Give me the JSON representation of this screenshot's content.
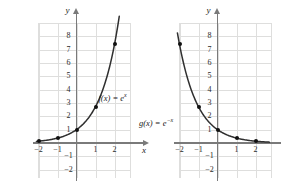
{
  "figure": {
    "title": "",
    "background": "#ffffff",
    "grid_color": "#dededd",
    "axis_color": "#7a7a7a",
    "curve_color": "#2f2f2f",
    "point_color": "#111111"
  },
  "chart_data": [
    {
      "type": "line",
      "title": "",
      "label": "f(x) = e^x",
      "label_display": "f(x) = e",
      "label_exponent": "x",
      "xlabel": "x",
      "ylabel": "y",
      "xlim": [
        -2.85,
        2.85
      ],
      "ylim": [
        -2.6,
        8.9
      ],
      "grid": true,
      "legend": "none",
      "x_ticks": [
        -2,
        -1,
        1,
        2
      ],
      "x_tick_labels": [
        "−2",
        "−1",
        "1",
        "2"
      ],
      "y_ticks": [
        8,
        7,
        6,
        5,
        4,
        3,
        2,
        1,
        -1,
        -2
      ],
      "y_tick_labels": [
        "8",
        "7",
        "6",
        "5",
        "4",
        "3",
        "2",
        "1",
        "−1",
        "−2"
      ],
      "points_x": [
        -2,
        -1,
        0,
        1,
        2
      ],
      "points_y": [
        0.14,
        0.37,
        1,
        2.72,
        7.39
      ],
      "curve_formula": "y = e^x"
    },
    {
      "type": "line",
      "title": "",
      "label": "g(x) = e^-x",
      "label_display": "g(x) = e",
      "label_exponent": "−x",
      "xlabel": "x",
      "ylabel": "y",
      "xlim": [
        -2.85,
        2.85
      ],
      "ylim": [
        -2.6,
        8.9
      ],
      "grid": true,
      "legend": "none",
      "x_ticks": [
        -2,
        -1,
        1,
        2
      ],
      "x_tick_labels": [
        "−2",
        "−1",
        "1",
        "2"
      ],
      "y_ticks": [
        8,
        7,
        6,
        5,
        4,
        3,
        2,
        1,
        -1,
        -2
      ],
      "y_tick_labels": [
        "8",
        "7",
        "6",
        "5",
        "4",
        "3",
        "2",
        "1",
        "−1",
        "−2"
      ],
      "points_x": [
        -2,
        -1,
        0,
        1,
        2
      ],
      "points_y": [
        7.39,
        2.72,
        1,
        0.37,
        0.14
      ],
      "curve_formula": "y = e^(-x)"
    }
  ]
}
